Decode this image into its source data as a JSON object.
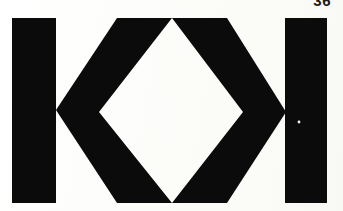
{
  "document": {
    "kind": "scanned-book-page",
    "page_number": "36",
    "background_color": "#fdfdfb",
    "ink_color": "#0b0b0b",
    "width": 343,
    "height": 211
  },
  "figure": {
    "name": "k-diamond-logotype",
    "ink_color": "#0b0b0b",
    "knockout_color": "#fdfdfb",
    "marks": [
      {
        "name": "left-vertical-bar",
        "shape": "rect",
        "x": 12,
        "y": 18,
        "width": 44,
        "height": 185
      },
      {
        "name": "left-chevron",
        "shape": "polygon",
        "points": "117,18 172,18 99,112 172,203 117,203 56,110"
      },
      {
        "name": "right-chevron",
        "shape": "polygon",
        "points": "172,18 227,18 286,112 227,203 172,203 243,112"
      },
      {
        "name": "right-vertical-bar",
        "shape": "rect",
        "x": 285,
        "y": 18,
        "width": 42,
        "height": 185
      },
      {
        "name": "scan-speck",
        "shape": "dot",
        "x": 299,
        "y": 122,
        "r": 1.4
      }
    ]
  }
}
